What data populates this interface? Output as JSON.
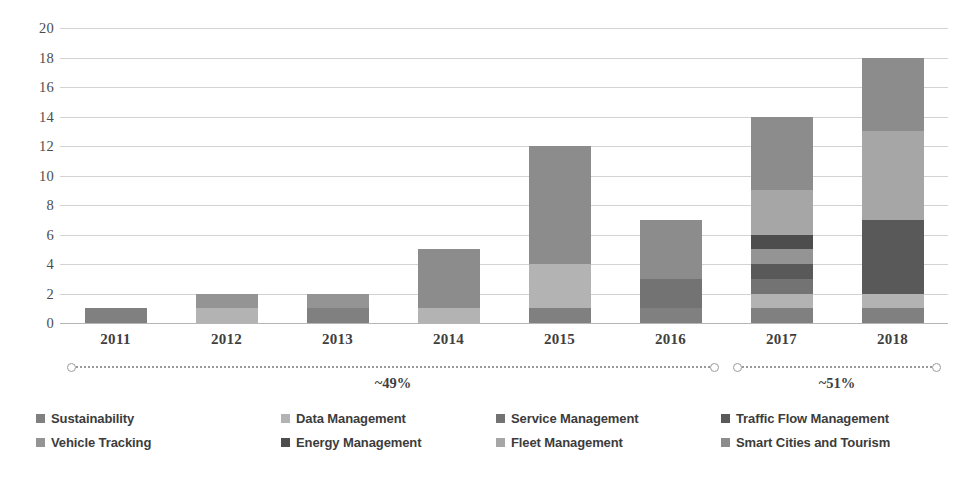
{
  "chart_data": {
    "type": "bar",
    "title": "",
    "subtitle": "",
    "xlabel": "",
    "ylabel": "",
    "stacked": true,
    "grid": true,
    "legend_position": "bottom",
    "ylim": [
      0,
      20
    ],
    "ytick_step": 2,
    "categories": [
      "2011",
      "2012",
      "2013",
      "2014",
      "2015",
      "2016",
      "2017",
      "2018"
    ],
    "ytick_labels": [
      "20",
      "18",
      "16",
      "14",
      "12",
      "10",
      "8",
      "6",
      "4",
      "2",
      "0"
    ],
    "series": [
      {
        "name": "Sustainability",
        "color": "#808080",
        "values": [
          1,
          0,
          1,
          0,
          1,
          1,
          1,
          1
        ]
      },
      {
        "name": "Data Management",
        "color": "#b3b3b3",
        "values": [
          0,
          1,
          0,
          1,
          3,
          0,
          1,
          1
        ]
      },
      {
        "name": "Service Management",
        "color": "#737373",
        "values": [
          0,
          0,
          0,
          0,
          0,
          2,
          1,
          0
        ]
      },
      {
        "name": "Traffic Flow Management",
        "color": "#595959",
        "values": [
          0,
          0,
          0,
          0,
          0,
          0,
          1,
          5
        ]
      },
      {
        "name": "Vehicle Tracking",
        "color": "#949494",
        "values": [
          0,
          1,
          1,
          0,
          0,
          0,
          1,
          0
        ]
      },
      {
        "name": "Energy Management",
        "color": "#4d4d4d",
        "values": [
          0,
          0,
          0,
          0,
          0,
          0,
          1,
          0
        ]
      },
      {
        "name": "Fleet Management",
        "color": "#a6a6a6",
        "values": [
          0,
          0,
          0,
          0,
          0,
          0,
          3,
          6
        ]
      },
      {
        "name": "Smart Cities and Tourism",
        "color": "#8c8c8c",
        "values": [
          0,
          0,
          0,
          4,
          8,
          4,
          5,
          5
        ]
      }
    ],
    "totals": [
      1,
      2,
      2,
      5,
      12,
      7,
      14,
      18
    ],
    "annotations": [
      {
        "label": "~49%",
        "span_start": "2011",
        "span_end": "2016"
      },
      {
        "label": "~51%",
        "span_start": "2017",
        "span_end": "2018"
      }
    ]
  },
  "legend": {
    "items": [
      {
        "label": "Sustainability",
        "color": "#808080"
      },
      {
        "label": "Data Management",
        "color": "#b3b3b3"
      },
      {
        "label": "Service Management",
        "color": "#737373"
      },
      {
        "label": "Traffic Flow Management",
        "color": "#595959"
      },
      {
        "label": "Vehicle Tracking",
        "color": "#949494"
      },
      {
        "label": "Energy Management",
        "color": "#4d4d4d"
      },
      {
        "label": "Fleet Management",
        "color": "#a6a6a6"
      },
      {
        "label": "Smart Cities and Tourism",
        "color": "#8c8c8c"
      }
    ]
  },
  "colors": {
    "gridline": "#d3d3d3",
    "axis": "#b5b5b5",
    "text": "#3f3f3f",
    "background": "#ffffff",
    "bracket": "#9a9a9a"
  }
}
